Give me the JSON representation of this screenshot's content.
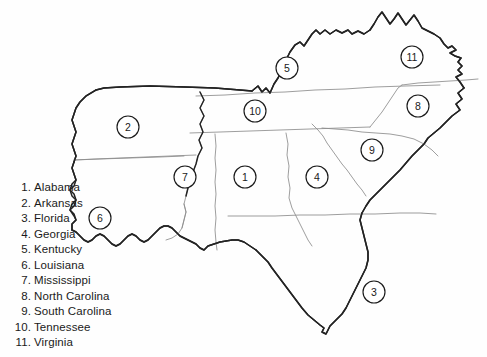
{
  "figure": {
    "background_color": "#fefefe",
    "outline_color": "#1d1d1d",
    "inner_border_color": "#8d8d8d",
    "marker_text_color": "#1a1a1a"
  },
  "legend": {
    "items": [
      {
        "number": "1.",
        "name": "Alabama"
      },
      {
        "number": "2.",
        "name": "Arkansas"
      },
      {
        "number": "3.",
        "name": "Florida"
      },
      {
        "number": "4.",
        "name": "Georgia"
      },
      {
        "number": "5.",
        "name": "Kentucky"
      },
      {
        "number": "6.",
        "name": "Louisiana"
      },
      {
        "number": "7.",
        "name": "Mississippi"
      },
      {
        "number": "8.",
        "name": "North Carolina"
      },
      {
        "number": "9.",
        "name": "South Carolina"
      },
      {
        "number": "10.",
        "name": "Tennessee"
      },
      {
        "number": "11.",
        "name": "Virginia"
      }
    ]
  },
  "map": {
    "markers": [
      {
        "label": "1",
        "state": "Alabama",
        "cx": 245,
        "cy": 177,
        "r": 11
      },
      {
        "label": "2",
        "state": "Arkansas",
        "cx": 128,
        "cy": 127,
        "r": 11
      },
      {
        "label": "3",
        "state": "Florida",
        "cx": 374,
        "cy": 292,
        "r": 11
      },
      {
        "label": "4",
        "state": "Georgia",
        "cx": 317,
        "cy": 177,
        "r": 11
      },
      {
        "label": "5",
        "state": "Kentucky",
        "cx": 287,
        "cy": 68,
        "r": 11
      },
      {
        "label": "6",
        "state": "Louisiana",
        "cx": 100,
        "cy": 218,
        "r": 11
      },
      {
        "label": "7",
        "state": "Mississippi",
        "cx": 185,
        "cy": 177,
        "r": 11
      },
      {
        "label": "8",
        "state": "North Carolina",
        "cx": 418,
        "cy": 106,
        "r": 11
      },
      {
        "label": "9",
        "state": "South Carolina",
        "cx": 372,
        "cy": 150,
        "r": 11
      },
      {
        "label": "10",
        "state": "Tennessee",
        "cx": 255,
        "cy": 111,
        "r": 11
      },
      {
        "label": "11",
        "state": "Virginia",
        "cx": 412,
        "cy": 57,
        "r": 11
      }
    ]
  }
}
